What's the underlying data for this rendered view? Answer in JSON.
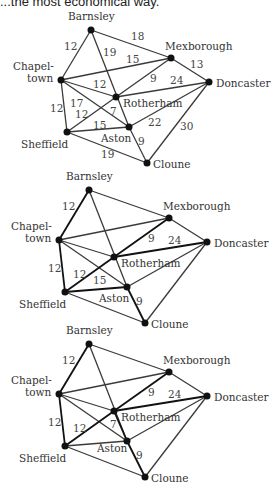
{
  "caption": "...the most economical way.",
  "nodes": {
    "barnsley": {
      "label": "Barnsley",
      "x": 91,
      "y": 30
    },
    "mexborough": {
      "label": "Mexborough",
      "x": 171,
      "y": 58
    },
    "chapeltown": {
      "label1": "Chapel-",
      "label2": "town",
      "x": 61,
      "y": 80
    },
    "doncaster": {
      "label": "Doncaster",
      "x": 209,
      "y": 82
    },
    "rotherham": {
      "label": "Rotherham",
      "x": 116,
      "y": 97
    },
    "sheffield": {
      "label": "Sheffield",
      "x": 67,
      "y": 132
    },
    "aston": {
      "label": "Aston",
      "x": 129,
      "y": 127
    },
    "cloune": {
      "label": "Cloune",
      "x": 147,
      "y": 163
    }
  },
  "graphs": [
    {
      "name": "full-network",
      "offset_y": 0,
      "weights": {
        "barnsley_chapeltown": "12",
        "barnsley_mexborough": "18",
        "barnsley_aston": "19",
        "chapeltown_mexborough": "15",
        "mexborough_doncaster": "13",
        "chapeltown_rotherham": "12",
        "rotherham_mexborough": "9",
        "rotherham_doncaster": "24",
        "chapeltown_sheffield": "12",
        "chapeltown_aston": "17",
        "sheffield_rotherham": "12",
        "rotherham_aston": "7",
        "sheffield_aston": "15",
        "aston_doncaster": "22",
        "doncaster_cloune": "30",
        "aston_cloune": "9",
        "sheffield_cloune": "19"
      }
    },
    {
      "name": "spanning-tree-step-1",
      "offset_y": 160,
      "weights": {
        "barnsley_chapeltown": "12",
        "rotherham_mexborough": "9",
        "rotherham_doncaster": "24",
        "chapeltown_sheffield": "12",
        "sheffield_rotherham": "12",
        "sheffield_aston": "15",
        "aston_cloune": "9"
      }
    },
    {
      "name": "spanning-tree-step-2",
      "offset_y": 314,
      "weights": {
        "barnsley_chapeltown": "12",
        "rotherham_mexborough": "9",
        "rotherham_doncaster": "24",
        "chapeltown_sheffield": "12",
        "sheffield_rotherham": "12",
        "rotherham_aston": "7",
        "aston_cloune": "9"
      }
    }
  ]
}
